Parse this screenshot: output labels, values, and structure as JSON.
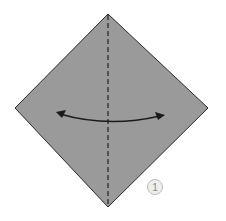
{
  "diagram": {
    "step_label": "1",
    "paper_color": "#9a9a9a",
    "line_color": "#222222",
    "fold": "valley fold along vertical diagonal, then unfold"
  }
}
